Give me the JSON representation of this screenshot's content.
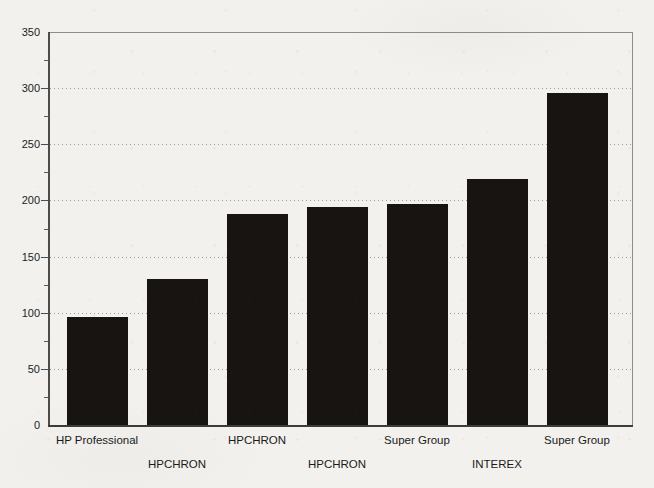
{
  "page": {
    "paper_color": "#f2f1ee",
    "description_title": ""
  },
  "chart_data": {
    "type": "bar",
    "categories": [
      "HP Professional",
      "HPCHRON",
      "HPCHRON",
      "HPCHRON",
      "Super Group",
      "INTEREX",
      "Super Group"
    ],
    "values": [
      96,
      130,
      188,
      194,
      197,
      219,
      296
    ],
    "title": "",
    "xlabel": "",
    "ylabel": "",
    "ylim": [
      0,
      350
    ],
    "y_major_tick_step": 50,
    "y_minor_tick_step": 25,
    "y_tick_labels": [
      "0",
      "50",
      "100",
      "150",
      "200",
      "250",
      "300",
      "350"
    ],
    "grid": "horizontal dotted gridlines at 50 through 300",
    "legend_position": "none",
    "bar_color": "#171412",
    "x_label_rows": [
      1,
      2,
      1,
      2,
      1,
      2,
      1
    ]
  }
}
